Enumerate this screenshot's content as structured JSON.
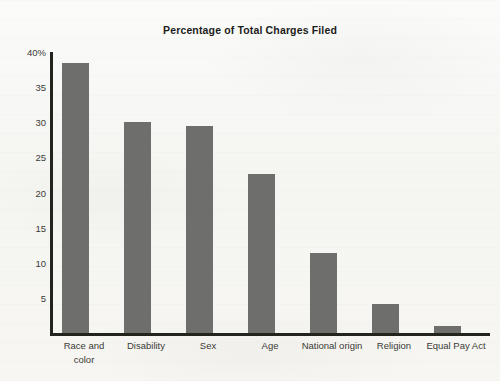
{
  "chart_data": {
    "type": "bar",
    "title": "Percentage of Total Charges Filed",
    "xlabel": "",
    "ylabel": "",
    "categories": [
      "Race and color",
      "Disability",
      "Sex",
      "Age",
      "National origin",
      "Religion",
      "Equal Pay Act"
    ],
    "values": [
      38.5,
      30.0,
      29.4,
      22.6,
      11.4,
      4.2,
      1.0
    ],
    "ylim": [
      0,
      40
    ],
    "y_ticks": [
      5,
      10,
      15,
      20,
      25,
      30,
      35,
      40
    ],
    "y_tick_labels": [
      "5",
      "10",
      "15",
      "20",
      "25",
      "30",
      "35",
      "40%"
    ],
    "grid": false,
    "legend": null,
    "bar_color": "#6e6e6c",
    "axis_color": "#24241f",
    "background_color": "#f7f7f5"
  }
}
